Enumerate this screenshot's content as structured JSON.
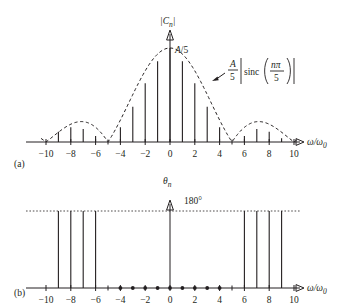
{
  "figure": {
    "panels": [
      {
        "id": "a",
        "panel_label": "(a)",
        "y_axis_label": "|C_n|",
        "peak_label": "A/5",
        "envelope_annotation": "(A/5)|sinc(nπ/5)|",
        "x_axis_label": "ω/ω₀"
      },
      {
        "id": "b",
        "panel_label": "(b)",
        "y_axis_label": "θ_n",
        "level_label": "180°",
        "x_axis_label": "ω/ω₀"
      }
    ],
    "tick_labels": [
      "-10",
      "-8",
      "-6",
      "-4",
      "-2",
      "0",
      "2",
      "4",
      "6",
      "8",
      "10"
    ],
    "colors": {
      "ink": "#231f20",
      "background": "#ffffff"
    }
  },
  "chart_data": [
    {
      "type": "bar",
      "panel": "a",
      "title": "|C_n| magnitude line spectrum",
      "xlabel": "ω/ω₀",
      "ylabel": "|C_n|",
      "xlim": [
        -10.8,
        10.8
      ],
      "ylim": [
        0,
        1.0
      ],
      "grid": false,
      "legend": "none",
      "annotations": [
        "A/5",
        "(A/5)|sinc(nπ/5)|"
      ],
      "categories": [
        -10,
        -9,
        -8,
        -7,
        -6,
        -5,
        -4,
        -3,
        -2,
        -1,
        0,
        1,
        2,
        3,
        4,
        5,
        6,
        7,
        8,
        9,
        10
      ],
      "values": [
        0,
        0.109,
        0.156,
        0.137,
        0.064,
        0,
        0.156,
        0.374,
        0.624,
        0.858,
        1.0,
        0.858,
        0.624,
        0.374,
        0.156,
        0,
        0.064,
        0.137,
        0.109,
        0.041,
        0
      ],
      "envelope": {
        "expression": "(A/5)|sinc(nπ/5)|",
        "zeros": [
          -10,
          -5,
          5,
          10
        ],
        "peak_value_label": "A/5",
        "style": "dashed"
      }
    },
    {
      "type": "bar",
      "panel": "b",
      "title": "θ_n phase line spectrum",
      "xlabel": "ω/ω₀",
      "ylabel": "θ_n",
      "xlim": [
        -10.8,
        10.8
      ],
      "ylim": [
        0,
        200
      ],
      "grid": false,
      "legend": "none",
      "annotations": [
        "180°"
      ],
      "reference_line": 180,
      "categories": [
        -10,
        -9,
        -8,
        -7,
        -6,
        -5,
        -4,
        -3,
        -2,
        -1,
        0,
        1,
        2,
        3,
        4,
        5,
        6,
        7,
        8,
        9,
        10
      ],
      "values": [
        0,
        180,
        180,
        180,
        180,
        0,
        0,
        0,
        0,
        0,
        0,
        0,
        0,
        0,
        0,
        0,
        180,
        180,
        180,
        180,
        0
      ],
      "zero_markers": [
        -4,
        -3,
        -2,
        -1,
        0,
        1,
        2,
        3,
        4
      ]
    }
  ]
}
